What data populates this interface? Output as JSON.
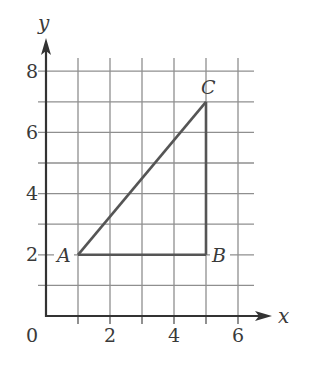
{
  "diagram": {
    "type": "coordinate-grid-triangle",
    "axes": {
      "x_label": "x",
      "y_label": "y",
      "origin_label": "0",
      "x_ticks": [
        "2",
        "4",
        "6"
      ],
      "y_ticks": [
        "2",
        "4",
        "6",
        "8"
      ],
      "x_range": [
        0,
        6.5
      ],
      "y_range": [
        0,
        8.5
      ]
    },
    "points": {
      "A": {
        "label": "A",
        "x": 1,
        "y": 2
      },
      "B": {
        "label": "B",
        "x": 5,
        "y": 2
      },
      "C": {
        "label": "C",
        "x": 5,
        "y": 7
      }
    },
    "colors": {
      "grid": "#8a8a8a",
      "axis": "#333333",
      "triangle": "#555555",
      "text": "#3a3a3a"
    }
  }
}
